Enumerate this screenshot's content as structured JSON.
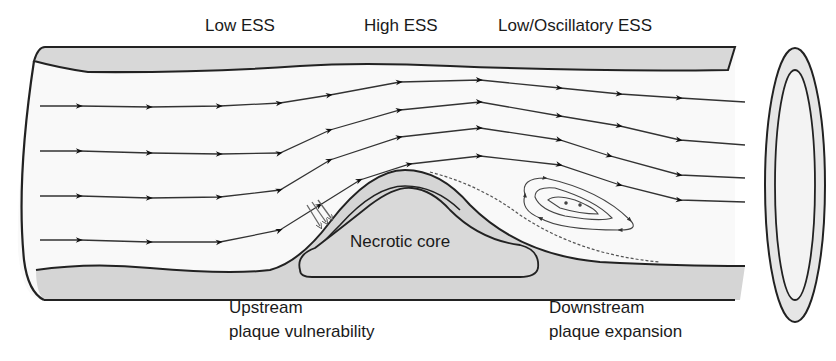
{
  "labels": {
    "low_ess": "Low ESS",
    "high_ess": "High ESS",
    "low_osc_ess": "Low/Oscillatory ESS",
    "necrotic_core": "Necrotic core",
    "upstream_1": "Upstream",
    "upstream_2": "plaque vulnerability",
    "downstream_1": "Downstream",
    "downstream_2": "plaque expansion"
  },
  "colors": {
    "wall": "#d9d9d9",
    "plaque": "#cfcfcf",
    "core": "#dcdcdc",
    "line": "#222222",
    "lumen": "#fafafa"
  }
}
